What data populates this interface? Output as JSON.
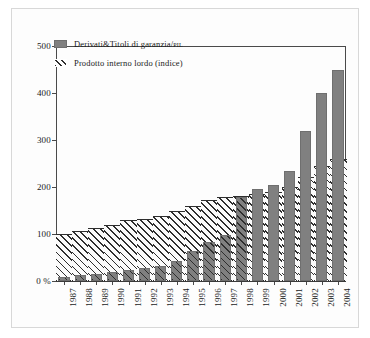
{
  "chart_data": {
    "type": "bar",
    "title": "",
    "subtitle": "",
    "xlabel": "",
    "ylabel": "",
    "ylim": [
      0,
      500
    ],
    "yticks": [
      0,
      100,
      200,
      300,
      400,
      500
    ],
    "ytick_labels": [
      "0 %",
      "100",
      "200",
      "300",
      "400",
      "500"
    ],
    "grid": false,
    "legend_position": "upper left",
    "categories": [
      "1987",
      "1988",
      "1989",
      "1990",
      "1991",
      "1992",
      "1993",
      "1994",
      "1995",
      "1996",
      "1997",
      "1998",
      "1999",
      "2000",
      "2001",
      "2002",
      "2003",
      "2004"
    ],
    "series": [
      {
        "name": "Derivati&Titoli di garanzia/PIL",
        "name_main": "Derivati&Titoli di garanzia/",
        "name_suffix": "PIL",
        "style": "solid-gray-bar",
        "color": "#808080",
        "values": [
          8,
          12,
          15,
          20,
          24,
          27,
          33,
          43,
          63,
          82,
          97,
          178,
          196,
          205,
          234,
          319,
          399,
          449
        ]
      },
      {
        "name": "Prodotto interno lordo (indice)",
        "style": "diagonal-hatch-area",
        "color": "#2e2e2e",
        "values": [
          100,
          107,
          113,
          120,
          129,
          133,
          139,
          148,
          160,
          172,
          179,
          180,
          185,
          190,
          201,
          222,
          244,
          259
        ]
      }
    ]
  },
  "legend": {
    "entries": [
      {
        "label": "Derivati&Titoli di garanzia/",
        "suffix": "PIL",
        "swatch": "solid-gray-swatch"
      },
      {
        "label": "Prodotto interno lordo (indice)",
        "suffix": "",
        "swatch": "hatched-swatch"
      }
    ]
  }
}
